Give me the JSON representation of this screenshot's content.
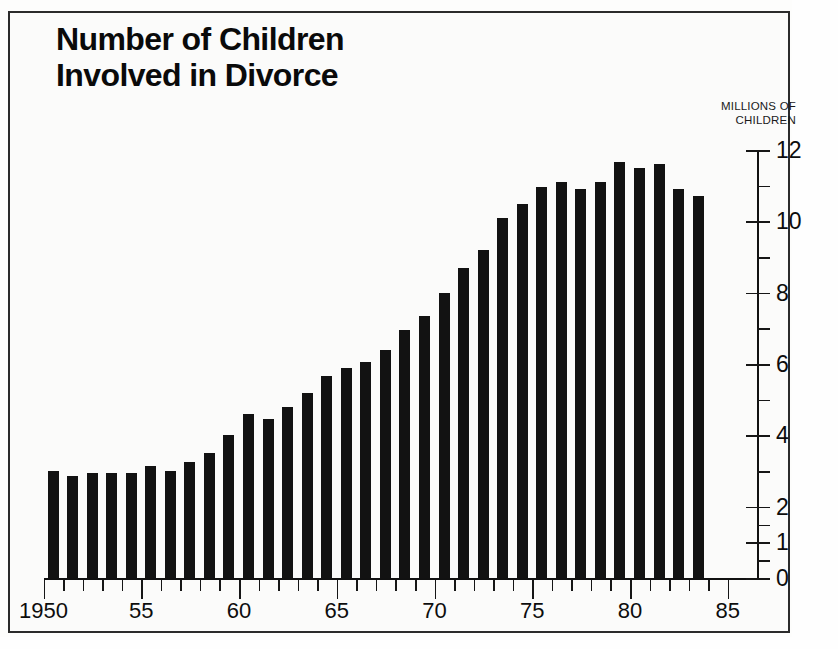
{
  "title": {
    "line1": "Number of Children",
    "line2": "Involved in Divorce"
  },
  "axis_caption": {
    "line1": "MILLIONS OF",
    "line2": "CHILDREN"
  },
  "colors": {
    "bar": "#121212",
    "axis": "#111111",
    "frame": "#2b2b2b",
    "background": "#fbfbfa",
    "text": "#0d0d0d"
  },
  "chart_data": {
    "type": "bar",
    "title": "Number of Children Involved in Divorce",
    "xlabel": "",
    "ylabel": "MILLIONS OF CHILDREN",
    "ylim": [
      0,
      12
    ],
    "xlim": [
      1949,
      1985
    ],
    "grid": false,
    "legend": null,
    "y_tick_labels": [
      "12",
      "10",
      "8",
      "6",
      "4",
      "2",
      "1",
      "0"
    ],
    "y_tick_values": [
      12,
      10,
      8,
      6,
      4,
      2,
      1,
      0
    ],
    "y_minor_tick_values": [
      11,
      9,
      7,
      5,
      3,
      1.5,
      0.5
    ],
    "x_tick_labels": [
      "1950",
      "55",
      "60",
      "65",
      "70",
      "75",
      "80",
      "85"
    ],
    "x_tick_values": [
      1950,
      1955,
      1960,
      1965,
      1970,
      1975,
      1980,
      1985
    ],
    "categories": [
      1950,
      1951,
      1952,
      1953,
      1954,
      1955,
      1956,
      1957,
      1958,
      1959,
      1960,
      1961,
      1962,
      1963,
      1964,
      1965,
      1966,
      1967,
      1968,
      1969,
      1970,
      1971,
      1972,
      1973,
      1974,
      1975,
      1976,
      1977,
      1978,
      1979,
      1980,
      1981,
      1982,
      1983
    ],
    "values": [
      3.0,
      2.85,
      2.95,
      2.95,
      2.95,
      3.15,
      3.0,
      3.25,
      3.5,
      4.0,
      4.6,
      4.45,
      4.8,
      5.2,
      5.65,
      5.9,
      6.05,
      6.4,
      6.95,
      7.35,
      8.0,
      8.7,
      9.2,
      10.1,
      10.5,
      10.95,
      11.1,
      10.9,
      11.1,
      11.65,
      11.5,
      11.6,
      10.9,
      10.7
    ]
  }
}
